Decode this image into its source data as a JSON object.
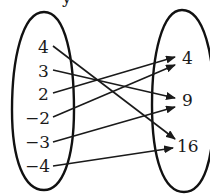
{
  "diagram": {
    "type": "mapping",
    "top_partial_label": "y",
    "domain_set": {
      "values": [
        "4",
        "3",
        "2",
        "−2",
        "−3",
        "−4"
      ]
    },
    "range_set": {
      "values": [
        "4",
        "9",
        "16"
      ]
    },
    "mappings": [
      {
        "from": "4",
        "to": "16"
      },
      {
        "from": "3",
        "to": "9"
      },
      {
        "from": "2",
        "to": "4"
      },
      {
        "from": "−2",
        "to": "4"
      },
      {
        "from": "−3",
        "to": "9"
      },
      {
        "from": "−4",
        "to": "16"
      }
    ],
    "colors": {
      "stroke": "#111111",
      "text": "#1a1a1a",
      "background": "#ffffff"
    }
  }
}
